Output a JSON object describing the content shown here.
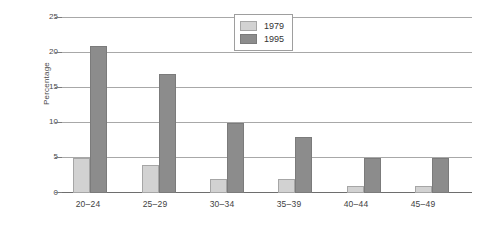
{
  "chart_data": {
    "type": "bar",
    "title": "",
    "xlabel": "",
    "ylabel": "Percentage",
    "ylim": [
      0,
      25
    ],
    "yticks": [
      0,
      5,
      10,
      15,
      20,
      25
    ],
    "grid": true,
    "legend_position": "top-center",
    "categories": [
      "20–24",
      "25–29",
      "30–34",
      "35–39",
      "40–44",
      "45–49"
    ],
    "series": [
      {
        "name": "1979",
        "color": "#d2d2d2",
        "values": [
          5,
          4,
          2,
          2,
          1,
          1
        ]
      },
      {
        "name": "1995",
        "color": "#8c8c8c",
        "values": [
          21,
          17,
          10,
          8,
          5,
          5
        ]
      }
    ]
  },
  "axis": {
    "y_title": "Percentage",
    "y_tick_labels": [
      "0",
      "5",
      "10",
      "15",
      "20",
      "25"
    ],
    "x_tick_labels": [
      "20–24",
      "25–29",
      "30–34",
      "35–39",
      "40–44",
      "45–49"
    ]
  },
  "legend": {
    "entries": [
      {
        "label": "1979"
      },
      {
        "label": "1995"
      }
    ]
  },
  "colors": {
    "series_1979": "#d2d2d2",
    "series_1995": "#8c8c8c",
    "gridline": "#a8a8a8",
    "axis": "#6e6e6e",
    "background": "#ffffff"
  }
}
